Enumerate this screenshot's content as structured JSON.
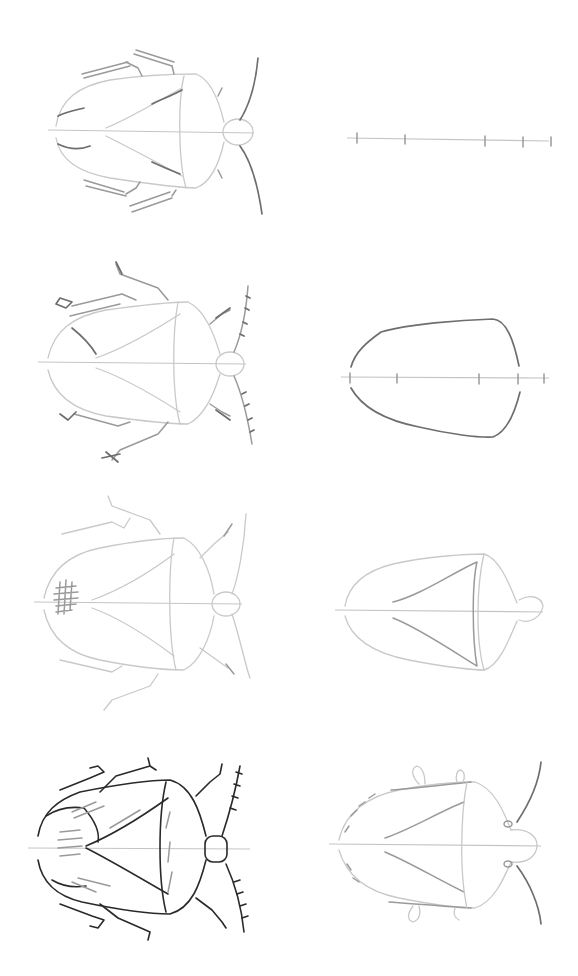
{
  "illustration": {
    "subject": "shield bug drawing tutorial",
    "layout": {
      "columns": 2,
      "rows": 4
    },
    "colors": {
      "background": "#ffffff",
      "light_pencil": "#c9c9c9",
      "medium_pencil": "#9a9a9a",
      "dark_pencil": "#6e6e6e",
      "ink": "#2a2a2a"
    },
    "panels": [
      {
        "position": "right-row-1",
        "content": "center line with proportion tick marks"
      },
      {
        "position": "right-row-2",
        "content": "body outline"
      },
      {
        "position": "right-row-3",
        "content": "pronotum, scutellum and head"
      },
      {
        "position": "right-row-4",
        "content": "wing lines, eyes, antennae and leg stubs"
      },
      {
        "position": "left-row-1",
        "content": "legs and antennae added"
      },
      {
        "position": "left-row-2",
        "content": "leg segments and antenna joints"
      },
      {
        "position": "left-row-3",
        "content": "hatching texture started"
      },
      {
        "position": "left-row-4",
        "content": "finished shaded drawing"
      }
    ]
  }
}
